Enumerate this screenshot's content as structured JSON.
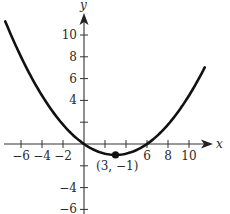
{
  "chart_data": {
    "type": "line",
    "title": "",
    "xlabel": "x",
    "ylabel": "y",
    "xlim": [
      -7.5,
      11.5
    ],
    "ylim": [
      -6,
      11
    ],
    "grid": false,
    "legend": null,
    "x_ticks": [
      -6,
      -4,
      -2,
      2,
      4,
      6,
      8,
      10
    ],
    "x_tick_labels": [
      "−6",
      "−4",
      "−2",
      "6",
      "8",
      "10"
    ],
    "x_tick_label_values": [
      -6,
      -4,
      -2,
      6,
      8,
      10
    ],
    "y_ticks": [
      10,
      8,
      6,
      4,
      2,
      -2,
      -4,
      -6
    ],
    "y_tick_labels": [
      "10",
      "8",
      "6",
      "4",
      "−4",
      "−6"
    ],
    "y_tick_label_values": [
      10,
      8,
      6,
      4,
      -4,
      -6
    ],
    "series": [
      {
        "name": "parabola",
        "equation": "y = (1/9)(x - 3)^2 - 1",
        "x": [
          -7.5,
          -6,
          -4,
          -2,
          0,
          2,
          3,
          4,
          6,
          8,
          10,
          11.5
        ],
        "y": [
          11.25,
          8,
          4.44,
          1.78,
          0,
          -0.89,
          -1,
          -0.89,
          0,
          1.78,
          4.44,
          7.03
        ]
      }
    ],
    "annotations": [
      {
        "type": "point",
        "x": 3,
        "y": -1,
        "label": "(3, −1)"
      }
    ]
  },
  "axes": {
    "x_name": "x",
    "y_name": "y"
  },
  "vertex": {
    "label": "(3, −1)"
  }
}
